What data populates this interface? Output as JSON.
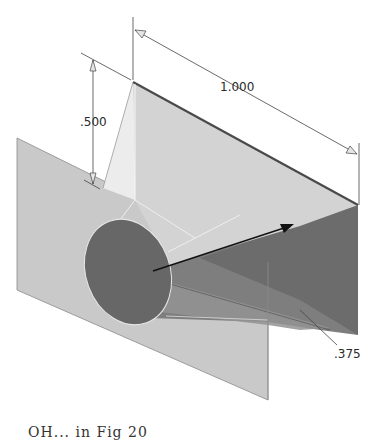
{
  "figure": {
    "colors": {
      "background": "#ffffff",
      "plane_fill": "#c8c8c8",
      "wedge_top_fill": "#cfcfcf",
      "wedge_light_face": "#e4e4e4",
      "dark_face": "#6e6e6e",
      "cone_mid": "#8a8a8a",
      "ellipse_fill": "#666666",
      "edge_dark": "#555555",
      "dimension_line": "#444444",
      "arrow": "#111111"
    }
  },
  "dimensions": {
    "length": {
      "label": "1.000"
    },
    "height": {
      "label": ".500"
    },
    "diameter": {
      "label": ".375"
    }
  },
  "caption": {
    "text": "OH... in Fig 20"
  }
}
